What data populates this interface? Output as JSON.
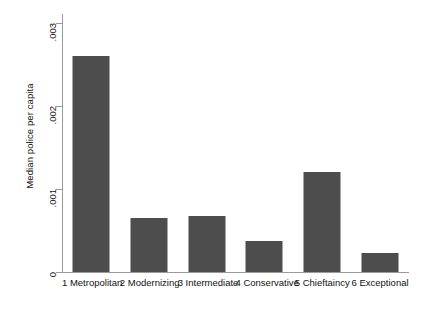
{
  "chart_data": {
    "type": "bar",
    "title": "",
    "xlabel": "",
    "ylabel": "Median police per capita",
    "categories": [
      "1 Metropolitan",
      "2 Modernizing",
      "3 Intermediate",
      "4 Conservative",
      "5 Chieftaincy",
      "6 Exceptional"
    ],
    "values": [
      0.0026,
      0.00065,
      0.00068,
      0.00037,
      0.00121,
      0.00023
    ],
    "ylim": [
      0,
      0.003
    ],
    "yticks": [
      0,
      0.001,
      0.002,
      0.003
    ],
    "ytick_labels": [
      "0",
      ".001",
      ".002",
      ".003"
    ],
    "grid": false,
    "legend": null,
    "bar_color": "#4d4d4d",
    "axis_color": "#9a9a9a",
    "background_color": "#ffffff"
  }
}
